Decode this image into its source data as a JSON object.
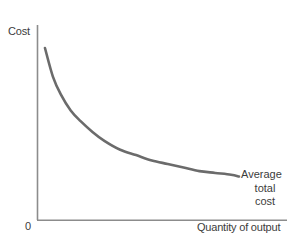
{
  "chart_data": {
    "type": "line",
    "title": "",
    "xlabel": "Quantity of output",
    "ylabel": "Cost",
    "origin_label": "0",
    "grid": false,
    "legend_position": "inline-right",
    "axis_color": "#8c8c8c",
    "curve_color": "#6b6b6b",
    "text_color": "#3c3c3c",
    "background_color": "#ffffff",
    "xlim": [
      0,
      100
    ],
    "ylim": [
      0,
      100
    ],
    "x_tick_labels": [],
    "y_tick_labels": [],
    "series": [
      {
        "name": "Average total cost",
        "annotation_lines": [
          "Average",
          "total",
          "cost"
        ],
        "shape": "decreasing-convex",
        "x": [
          2,
          6,
          10,
          15,
          20,
          26,
          32,
          40,
          48,
          56,
          64,
          72,
          80,
          88,
          96,
          100
        ],
        "y": [
          88,
          72,
          62,
          53,
          47,
          41,
          36,
          31,
          28,
          25,
          23,
          21,
          19,
          18,
          17,
          16
        ]
      }
    ]
  },
  "figure": {
    "y_axis_title": "Cost",
    "x_axis_title": "Quantity of output",
    "origin": "0",
    "annotation": {
      "line1": "Average",
      "line2": "total",
      "line3": "cost"
    }
  }
}
